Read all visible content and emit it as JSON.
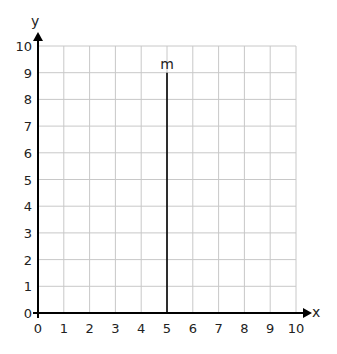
{
  "chart_data": {
    "type": "line",
    "title": "",
    "xlabel": "x",
    "ylabel": "y",
    "xlim": [
      0,
      10
    ],
    "ylim": [
      0,
      10
    ],
    "grid": true,
    "x_ticks": [
      "0",
      "1",
      "2",
      "3",
      "4",
      "5",
      "6",
      "7",
      "8",
      "9",
      "10"
    ],
    "y_ticks": [
      "0",
      "1",
      "2",
      "3",
      "4",
      "5",
      "6",
      "7",
      "8",
      "9",
      "10"
    ],
    "series": [
      {
        "name": "m",
        "x": [
          5,
          5
        ],
        "y": [
          0,
          9
        ],
        "label": "m"
      }
    ]
  },
  "colors": {
    "grid": "#c8c8c8",
    "axis": "#000000",
    "line": "#000000"
  }
}
